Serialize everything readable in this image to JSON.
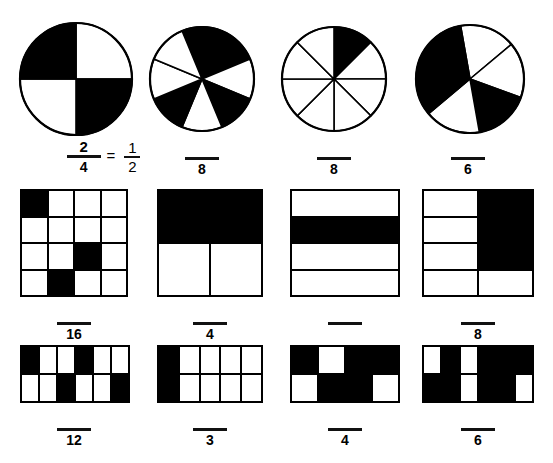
{
  "worksheet": {
    "title": "Fractions of shaded shapes worksheet",
    "ink_color": "#000000",
    "page_background": "#ffffff",
    "equals_sign": "=",
    "blank_label": ""
  },
  "rows": [
    {
      "name": "circles-row",
      "items": [
        {
          "id": "circle-1",
          "shape": "circle",
          "slices": 4,
          "start_angle": -90,
          "shaded_indices": [
            3,
            1
          ],
          "shaded_count": 2,
          "answer_shown": true,
          "numerator": "2",
          "denominator": "4",
          "has_equals": true,
          "equivalent_numerator": "1",
          "equivalent_denominator": "2"
        },
        {
          "id": "circle-2",
          "shape": "circle",
          "slices": 8,
          "start_angle": -112.5,
          "shaded_indices": [
            0,
            1,
            3,
            5
          ],
          "shaded_count": 4,
          "answer_shown": false,
          "numerator": "",
          "denominator": "8",
          "has_equals": false
        },
        {
          "id": "circle-3",
          "shape": "circle",
          "slices": 8,
          "start_angle": -90,
          "shaded_indices": [
            0
          ],
          "shaded_count": 1,
          "answer_shown": false,
          "numerator": "",
          "denominator": "8",
          "has_equals": false
        },
        {
          "id": "circle-4",
          "shape": "circle",
          "slices": 6,
          "start_angle": -100,
          "shaded_indices": [
            4,
            5,
            2
          ],
          "shaded_count": 3,
          "answer_shown": false,
          "numerator": "",
          "denominator": "6",
          "has_equals": false
        }
      ]
    },
    {
      "name": "squares-row",
      "items": [
        {
          "id": "grid-1",
          "shape": "grid",
          "cols": 4,
          "rows": 4,
          "total": 16,
          "shaded_indices": [
            0,
            10,
            13
          ],
          "shaded_count": 3,
          "answer_shown": false,
          "numerator": "",
          "denominator": "16"
        },
        {
          "id": "grid-2",
          "shape": "grid",
          "cols": 2,
          "rows": 2,
          "total": 4,
          "shaded_indices": [
            0,
            1
          ],
          "shaded_count": 2,
          "answer_shown": false,
          "numerator": "",
          "denominator": "4"
        },
        {
          "id": "grid-3",
          "shape": "grid",
          "cols": 1,
          "rows": 4,
          "total": 4,
          "shaded_indices": [
            1
          ],
          "shaded_count": 1,
          "answer_shown": false,
          "numerator": "",
          "denominator": ""
        },
        {
          "id": "grid-4",
          "shape": "grid",
          "cols": 2,
          "rows": 4,
          "total": 8,
          "shaded_indices": [
            1,
            3,
            5
          ],
          "shaded_count": 3,
          "answer_shown": false,
          "numerator": "",
          "denominator": "8"
        }
      ]
    },
    {
      "name": "rectangles-row",
      "items": [
        {
          "id": "grid-5",
          "shape": "grid",
          "cols": 6,
          "rows": 2,
          "total": 12,
          "shaded_indices": [
            0,
            3,
            8,
            11
          ],
          "shaded_count": 4,
          "answer_shown": false,
          "numerator": "",
          "denominator": "12"
        },
        {
          "id": "grid-6",
          "shape": "grid",
          "cols": 5,
          "rows": 2,
          "total": 10,
          "shaded_indices": [
            0,
            5
          ],
          "shaded_count": 2,
          "answer_shown": false,
          "numerator": "",
          "denominator": "3"
        },
        {
          "id": "grid-7",
          "shape": "grid",
          "cols": 4,
          "rows": 2,
          "total": 8,
          "shaded_indices": [
            0,
            2,
            3,
            5,
            6
          ],
          "shaded_count": 5,
          "answer_shown": false,
          "numerator": "",
          "denominator": "4"
        },
        {
          "id": "grid-8",
          "shape": "grid",
          "cols": 6,
          "rows": 2,
          "total": 12,
          "shaded_indices": [
            1,
            3,
            4,
            5,
            6,
            7,
            9,
            10
          ],
          "shaded_count": 8,
          "answer_shown": false,
          "numerator": "",
          "denominator": "6"
        }
      ]
    }
  ]
}
